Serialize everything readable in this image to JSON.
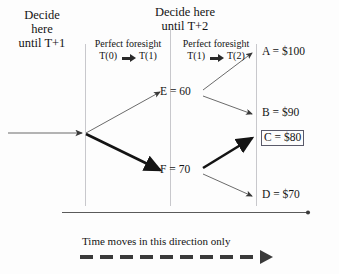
{
  "diagram": {
    "type": "decision-tree",
    "title_left": {
      "line1": "Decide",
      "line2": "here",
      "line3": "until T+1"
    },
    "title_mid": {
      "line1": "Decide here",
      "line2": "until T+2"
    },
    "foresight_left": {
      "label": "Perfect foresight",
      "from": "T(0)",
      "to": "T(1)",
      "arrow": "right-arrow-icon"
    },
    "foresight_right": {
      "label": "Perfect foresight",
      "from": "T(1)",
      "to": "T(2)",
      "arrow": "right-arrow-icon"
    },
    "nodes": [
      {
        "id": "E",
        "label": "E = 60"
      },
      {
        "id": "F",
        "label": "F = 70"
      }
    ],
    "terminals": [
      {
        "id": "A",
        "label": "A = $100",
        "boxed": false
      },
      {
        "id": "B",
        "label": "B = $90",
        "boxed": false
      },
      {
        "id": "C",
        "label": "C = $80",
        "boxed": true
      },
      {
        "id": "D",
        "label": "D = $70",
        "boxed": false
      }
    ],
    "caption": "Time moves in this direction only",
    "colors": {
      "ink": "#141414",
      "thin_line": "#6b6b6b",
      "bold_line": "#1a1a1a",
      "guide_line": "#c8c8cc",
      "box_border": "#5a5a6a",
      "background": "#fdfdfd"
    },
    "highlighted_path": [
      "root",
      "F",
      "C"
    ]
  }
}
